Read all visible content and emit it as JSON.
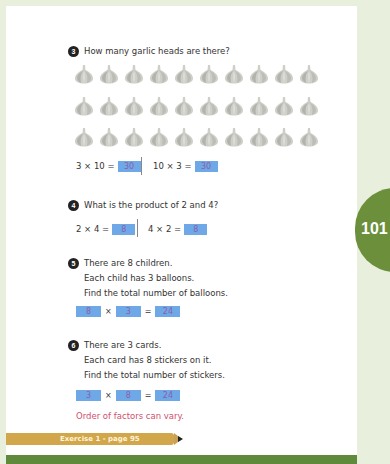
{
  "page": {
    "number": "101",
    "colors": {
      "background": "#e9efdd",
      "tab": "#6b8f3a",
      "answer_box": "#6fa8e6",
      "answer_text": "#8a5fae",
      "note": "#d0506e",
      "exercise_bar": "#d2a64a",
      "bottom_bar": "#5f8a3c"
    }
  },
  "questions": [
    {
      "number": "3",
      "lines": [
        "How many garlic heads are there?"
      ],
      "image": {
        "icon": "garlic-icon",
        "rows": 3,
        "per_row": 10
      },
      "equations": [
        {
          "expr": "3 × 10 =",
          "answer": "30"
        },
        {
          "expr": "10 × 3 =",
          "answer": "30"
        }
      ]
    },
    {
      "number": "4",
      "lines": [
        "What is the product of 2 and 4?"
      ],
      "equations": [
        {
          "expr": "2 × 4 =",
          "answer": "8"
        },
        {
          "expr": "4 × 2 =",
          "answer": "8"
        }
      ]
    },
    {
      "number": "5",
      "lines": [
        "There are 8 children.",
        "Each child has 3 balloons.",
        "Find the total number of balloons."
      ],
      "boxes": {
        "a": "8",
        "op": "×",
        "b": "3",
        "eq": "=",
        "result": "24"
      }
    },
    {
      "number": "6",
      "lines": [
        "There are 3 cards.",
        "Each card has 8 stickers on it.",
        "Find the total number of stickers."
      ],
      "boxes": {
        "a": "3",
        "op": "×",
        "b": "8",
        "eq": "=",
        "result": "24"
      }
    }
  ],
  "note": "Order of factors can vary.",
  "exercise": {
    "label": "Exercise 1 - page 95"
  }
}
